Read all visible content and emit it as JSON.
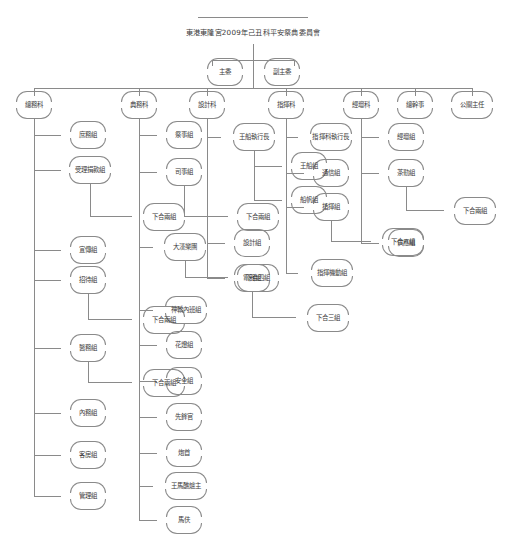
{
  "document": {
    "title": "東港東隆宮2009年己丑科平安祭典委員會",
    "type": "organization-chart",
    "language": "zh-Hant"
  },
  "top": {
    "chair": "主委",
    "vice_chair": "副主委"
  },
  "departments": [
    {
      "id": "general-affairs",
      "label": "總務科"
    },
    {
      "id": "ceremony-affairs",
      "label": "典務科"
    },
    {
      "id": "design",
      "label": "設計科"
    },
    {
      "id": "command",
      "label": "指揮科"
    },
    {
      "id": "sutra-altar",
      "label": "經壇科"
    },
    {
      "id": "secretary-general",
      "label": "總幹事"
    },
    {
      "id": "public-relations",
      "label": "公關主任"
    }
  ],
  "columns": [
    {
      "department": "總務科",
      "items": [
        {
          "label": "庶務組",
          "sub": null
        },
        {
          "label": "受理捐款組",
          "sub": "下合兩組"
        },
        {
          "label": "宣傳組",
          "sub": null
        },
        {
          "label": "招待組",
          "sub": "下合兩組"
        },
        {
          "label": "醫務組",
          "sub": "下合兩組"
        },
        {
          "label": "內務組",
          "sub": null
        },
        {
          "label": "客房組",
          "sub": null
        },
        {
          "label": "管理組",
          "sub": null
        }
      ]
    },
    {
      "department": "典務科",
      "items": [
        {
          "label": "祭事組",
          "sub": null
        },
        {
          "label": "司事組",
          "sub": "下合兩組"
        },
        {
          "label": "大漢樂團",
          "sub": "下合四組"
        },
        {
          "label": "神轎內班組",
          "sub": null
        },
        {
          "label": "花燈組",
          "sub": null
        },
        {
          "label": "安全組",
          "sub": null
        },
        {
          "label": "先鋒官",
          "sub": null
        },
        {
          "label": "炮首",
          "sub": null
        },
        {
          "label": "王馬醮爐主",
          "sub": null
        },
        {
          "label": "馬伕",
          "sub": null
        }
      ]
    },
    {
      "department": "設計科",
      "items": [
        {
          "label": "王船執行長",
          "sub": null
        },
        {
          "label": "王船組",
          "sub": null
        },
        {
          "label": "船帆組",
          "sub": null
        },
        {
          "label": "設計組",
          "sub": null
        },
        {
          "label": "電器組",
          "sub": "下合三組"
        }
      ]
    },
    {
      "department": "指揮科",
      "items": [
        {
          "label": "指揮科執行長",
          "sub": null
        },
        {
          "label": "通信組",
          "sub": null
        },
        {
          "label": "指揮組",
          "sub": "下合八組"
        },
        {
          "label": "指揮機動組",
          "sub": null
        }
      ]
    },
    {
      "department": "經壇科",
      "items": [
        {
          "label": "經壇組",
          "sub": null
        },
        {
          "label": "茶勤組",
          "sub": "下合兩組"
        },
        {
          "label": "供應組",
          "sub": null
        }
      ]
    }
  ],
  "colors": {
    "line": "#8a8a8a",
    "text": "#3a3a3a",
    "background": "#ffffff"
  }
}
